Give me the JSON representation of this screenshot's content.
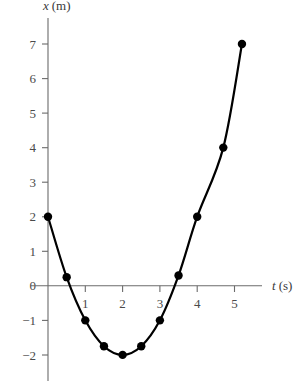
{
  "chart_data": {
    "type": "line",
    "title": "",
    "xlabel": "t (s)",
    "ylabel": "x (m)",
    "x": [
      0,
      0.5,
      1,
      1.5,
      2,
      2.5,
      3,
      3.5,
      4,
      4.7,
      5.2
    ],
    "values": [
      2,
      0.25,
      -1,
      -1.75,
      -2,
      -1.75,
      -1,
      0.3,
      2,
      4,
      7
    ],
    "series": [
      {
        "name": "position",
        "x": [
          0,
          0.5,
          1,
          1.5,
          2,
          2.5,
          3,
          3.5,
          4,
          4.7,
          5.2
        ],
        "values": [
          2,
          0.25,
          -1,
          -1.75,
          -2,
          -1.75,
          -1,
          0.3,
          2,
          4,
          7
        ]
      }
    ],
    "xlim": [
      0,
      5.6
    ],
    "ylim": [
      -2,
      7
    ],
    "xticks": [
      1,
      2,
      3,
      4,
      5
    ],
    "yticks": [
      -2,
      -1,
      0,
      1,
      2,
      3,
      4,
      5,
      6,
      7
    ],
    "xticklabels": [
      "1",
      "2",
      "3",
      "4",
      "5"
    ],
    "yticklabels": [
      "−2",
      "−1",
      "0",
      "1",
      "2",
      "3",
      "4",
      "5",
      "6",
      "7"
    ],
    "grid": false,
    "legend": null,
    "marker": "filled-circle",
    "line_color": "#000000",
    "axis_color": "#6b6b6b",
    "background": "#ffffff"
  },
  "axes": {
    "y_axis_label_var": "x",
    "y_axis_label_unit": "(m)",
    "x_axis_label_var": "t",
    "x_axis_label_unit": "(s)"
  }
}
